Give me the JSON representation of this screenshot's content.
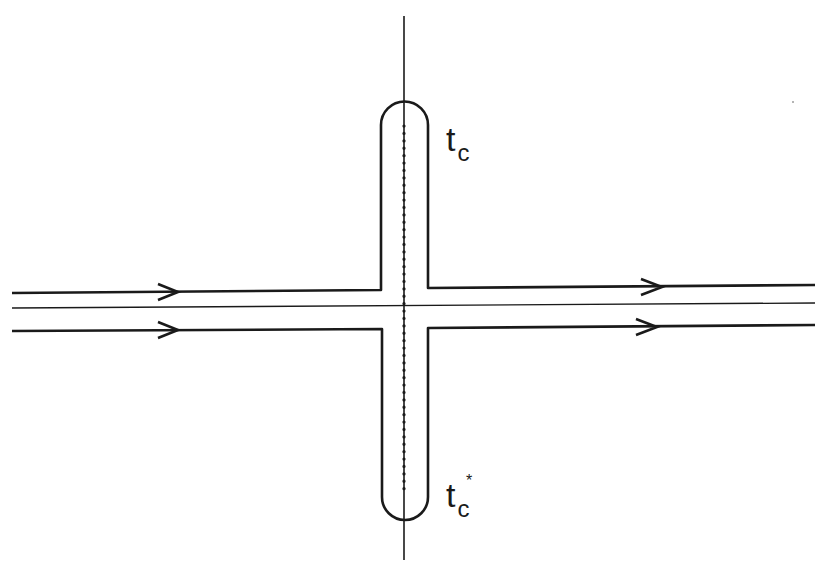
{
  "diagram": {
    "type": "contour-diagram",
    "labels": {
      "top_point": {
        "base": "t",
        "subscript": "c",
        "superscript": ""
      },
      "bottom_point": {
        "base": "t",
        "subscript": "c",
        "superscript": "*"
      }
    },
    "colors": {
      "stroke": "#1a1a1a",
      "background": "#ffffff"
    },
    "elements": {
      "vertical_axis": "solid line",
      "horizontal_axis": "thin solid line",
      "branch_cut": "dotted line",
      "contours": [
        "upper contour, left to right",
        "lower contour, left to right"
      ],
      "arrow_direction": "right"
    }
  }
}
